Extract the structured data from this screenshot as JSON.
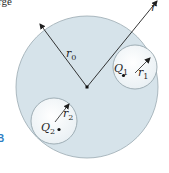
{
  "caption_fragment": "rge",
  "figure_label": "B",
  "colors": {
    "region_fill": "#d6e3ea",
    "cavity_fill": "#f4f8fa",
    "outline": "#8e9ea6",
    "ink": "#1f1f1f",
    "figure_label": "#2f7fc4"
  },
  "labels": {
    "r": "r",
    "r0": {
      "base": "r",
      "sub": "0"
    },
    "Q1": {
      "base": "Q",
      "sub": "1"
    },
    "r1": {
      "base": "r",
      "sub": "1"
    },
    "Q2": {
      "base": "Q",
      "sub": "2"
    },
    "r2": {
      "base": "r",
      "sub": "2"
    }
  }
}
